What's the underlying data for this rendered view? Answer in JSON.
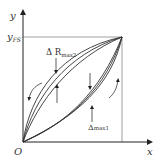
{
  "diagram": {
    "type": "hysteresis-nonlinearity-plot",
    "axes": {
      "x_label": "x",
      "y_label": "y",
      "origin_label": "O",
      "full_scale_label": "y",
      "full_scale_sub": "FS"
    },
    "annotations": {
      "delta_r_max2": {
        "prefix": "Δ R",
        "sub": "max2"
      },
      "delta_max1": {
        "prefix": "Δ",
        "sub": "max1"
      }
    },
    "curves": {
      "upper_bundle_count": 3,
      "lower_bundle_count": 3
    },
    "colors": {
      "line": "#333333",
      "axis": "#222222",
      "frame": "#888888"
    }
  }
}
